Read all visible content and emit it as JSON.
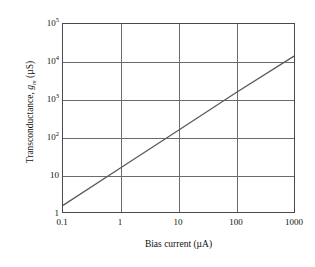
{
  "chart_data": {
    "type": "line",
    "title": "",
    "xlabel": "Bias current (µA)",
    "ylabel": "Transconductance, gₘ (µS)",
    "xscale": "log",
    "yscale": "log",
    "xlim": [
      0.1,
      1000
    ],
    "ylim": [
      1,
      100000
    ],
    "grid": true,
    "legend": false,
    "xticks": [
      "0.1",
      "1",
      "10",
      "100",
      "1000"
    ],
    "xtick_values": [
      0.1,
      1,
      10,
      100,
      1000
    ],
    "yticks": [
      "1",
      "10",
      "10²",
      "10³",
      "10⁴",
      "10⁵"
    ],
    "ytick_values": [
      1,
      10,
      100,
      1000,
      10000,
      100000
    ],
    "series": [
      {
        "name": "Transconductance vs bias current",
        "x": [
          0.1,
          1,
          10,
          100,
          1000
        ],
        "values": [
          1.5,
          15,
          150,
          1500,
          14000
        ]
      }
    ]
  },
  "axes": {
    "y_title_main": "Transconductance, ",
    "y_title_symbol": "g",
    "y_title_subscript": "m",
    "y_title_units": " (µS)",
    "x_title": "Bias current (µA)"
  },
  "yticks": [
    {
      "mantissa": "10",
      "exponent": "5"
    },
    {
      "mantissa": "10",
      "exponent": "4"
    },
    {
      "mantissa": "10",
      "exponent": "3"
    },
    {
      "mantissa": "10",
      "exponent": "2"
    },
    {
      "mantissa": "10",
      "exponent": ""
    },
    {
      "mantissa": "1",
      "exponent": ""
    }
  ],
  "xticks": [
    {
      "label": "0.1"
    },
    {
      "label": "1"
    },
    {
      "label": "10"
    },
    {
      "label": "100"
    },
    {
      "label": "1000"
    }
  ],
  "colors": {
    "line": "#5a5a5a",
    "grid": "#6b6b6b",
    "frame": "#4a4a4a",
    "text": "#111111",
    "background": "#ffffff"
  }
}
